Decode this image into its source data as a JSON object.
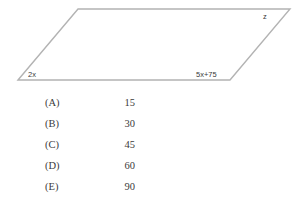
{
  "figure": {
    "shape": "parallelogram",
    "stroke_color": "#b3b3b3",
    "vertices": {
      "bottom_left": [
        18,
        80
      ],
      "top_left": [
        78,
        9
      ],
      "top_right": [
        290,
        9
      ],
      "bottom_right": [
        230,
        80
      ]
    },
    "labels": {
      "bottom_left_angle": "2x",
      "bottom_right_angle": "5x+75",
      "top_right_angle": "z"
    }
  },
  "choices": [
    {
      "key": "(A)",
      "value": "15"
    },
    {
      "key": "(B)",
      "value": "30"
    },
    {
      "key": "(C)",
      "value": "45"
    },
    {
      "key": "(D)",
      "value": "60"
    },
    {
      "key": "(E)",
      "value": "90"
    }
  ]
}
